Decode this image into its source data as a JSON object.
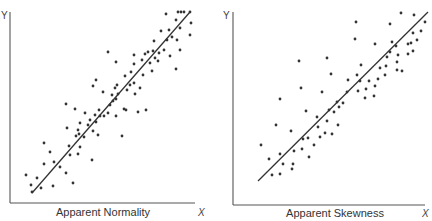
{
  "chart_data": [
    {
      "type": "scatter",
      "title": "Apparent Normality",
      "xlabel": "X",
      "ylabel": "Y",
      "grid": false,
      "legend": null,
      "axes": {
        "origin": [
          10,
          203
        ],
        "x_end": 195,
        "y_top": 12
      },
      "fit_line": {
        "x1": 32,
        "y1": 193,
        "x2": 190,
        "y2": 12
      },
      "points": [
        [
          26,
          175
        ],
        [
          31,
          185
        ],
        [
          37,
          178
        ],
        [
          32,
          192
        ],
        [
          41,
          188
        ],
        [
          53,
          186
        ],
        [
          73,
          183
        ],
        [
          44,
          143
        ],
        [
          50,
          152
        ],
        [
          44,
          164
        ],
        [
          54,
          162
        ],
        [
          60,
          167
        ],
        [
          66,
          173
        ],
        [
          66,
          104
        ],
        [
          75,
          109
        ],
        [
          67,
          128
        ],
        [
          69,
          146
        ],
        [
          70,
          155
        ],
        [
          78,
          154
        ],
        [
          79,
          134
        ],
        [
          76,
          136
        ],
        [
          78,
          130
        ],
        [
          80,
          123
        ],
        [
          80,
          147
        ],
        [
          85,
          113
        ],
        [
          84,
          137
        ],
        [
          88,
          125
        ],
        [
          90,
          120
        ],
        [
          93,
          131
        ],
        [
          93,
          86
        ],
        [
          96,
          80
        ],
        [
          92,
          160
        ],
        [
          95,
          115
        ],
        [
          96,
          122
        ],
        [
          98,
          135
        ],
        [
          99,
          110
        ],
        [
          100,
          116
        ],
        [
          103,
          92
        ],
        [
          104,
          116
        ],
        [
          108,
          113
        ],
        [
          108,
          52
        ],
        [
          110,
          105
        ],
        [
          112,
          95
        ],
        [
          113,
          101
        ],
        [
          115,
          88
        ],
        [
          116,
          99
        ],
        [
          116,
          62
        ],
        [
          117,
          85
        ],
        [
          116,
          116
        ],
        [
          118,
          94
        ],
        [
          122,
          136
        ],
        [
          124,
          109
        ],
        [
          125,
          76
        ],
        [
          127,
          90
        ],
        [
          126,
          110
        ],
        [
          130,
          85
        ],
        [
          131,
          72
        ],
        [
          134,
          83
        ],
        [
          134,
          55
        ],
        [
          134,
          64
        ],
        [
          135,
          94
        ],
        [
          138,
          112
        ],
        [
          140,
          88
        ],
        [
          142,
          60
        ],
        [
          143,
          75
        ],
        [
          146,
          110
        ],
        [
          145,
          54
        ],
        [
          148,
          52
        ],
        [
          150,
          63
        ],
        [
          152,
          71
        ],
        [
          153,
          51
        ],
        [
          154,
          41
        ],
        [
          155,
          58
        ],
        [
          158,
          61
        ],
        [
          159,
          53
        ],
        [
          161,
          31
        ],
        [
          164,
          50
        ],
        [
          166,
          14
        ],
        [
          167,
          40
        ],
        [
          169,
          30
        ],
        [
          170,
          56
        ],
        [
          172,
          37
        ],
        [
          176,
          69
        ],
        [
          176,
          20
        ],
        [
          177,
          40
        ],
        [
          178,
          12
        ],
        [
          180,
          28
        ],
        [
          180,
          50
        ],
        [
          181,
          12
        ],
        [
          184,
          12
        ],
        [
          190,
          12
        ],
        [
          191,
          23
        ],
        [
          190,
          35
        ]
      ]
    },
    {
      "type": "scatter",
      "title": "Apparent Skewness",
      "xlabel": "X",
      "ylabel": "Y",
      "grid": false,
      "legend": null,
      "axes": {
        "origin": [
          233,
          205
        ],
        "x_end": 425,
        "y_top": 12
      },
      "fit_line": {
        "x1": 258,
        "y1": 181,
        "x2": 428,
        "y2": 12
      },
      "points": [
        [
          261,
          145
        ],
        [
          269,
          159
        ],
        [
          272,
          175
        ],
        [
          280,
          99
        ],
        [
          276,
          125
        ],
        [
          280,
          174
        ],
        [
          280,
          154
        ],
        [
          283,
          164
        ],
        [
          291,
          131
        ],
        [
          292,
          169
        ],
        [
          293,
          164
        ],
        [
          294,
          151
        ],
        [
          299,
          61
        ],
        [
          301,
          88
        ],
        [
          302,
          149
        ],
        [
          303,
          139
        ],
        [
          306,
          111
        ],
        [
          308,
          138
        ],
        [
          309,
          157
        ],
        [
          314,
          145
        ],
        [
          318,
          127
        ],
        [
          317,
          117
        ],
        [
          320,
          137
        ],
        [
          322,
          92
        ],
        [
          325,
          133
        ],
        [
          327,
          58
        ],
        [
          327,
          121
        ],
        [
          329,
          110
        ],
        [
          331,
          74
        ],
        [
          332,
          134
        ],
        [
          334,
          112
        ],
        [
          337,
          102
        ],
        [
          338,
          125
        ],
        [
          339,
          107
        ],
        [
          343,
          103
        ],
        [
          347,
          92
        ],
        [
          348,
          80
        ],
        [
          355,
          39
        ],
        [
          356,
          22
        ],
        [
          357,
          75
        ],
        [
          358,
          91
        ],
        [
          361,
          65
        ],
        [
          360,
          81
        ],
        [
          365,
          98
        ],
        [
          366,
          89
        ],
        [
          369,
          81
        ],
        [
          374,
          96
        ],
        [
          375,
          86
        ],
        [
          375,
          44
        ],
        [
          378,
          79
        ],
        [
          380,
          68
        ],
        [
          385,
          75
        ],
        [
          386,
          66
        ],
        [
          387,
          57
        ],
        [
          390,
          24
        ],
        [
          390,
          52
        ],
        [
          392,
          42
        ],
        [
          396,
          46
        ],
        [
          397,
          70
        ],
        [
          397,
          62
        ],
        [
          398,
          55
        ],
        [
          401,
          13
        ],
        [
          402,
          71
        ],
        [
          408,
          54
        ],
        [
          408,
          44
        ],
        [
          411,
          43
        ],
        [
          413,
          51
        ],
        [
          414,
          15
        ],
        [
          413,
          33
        ],
        [
          417,
          40
        ],
        [
          421,
          31
        ],
        [
          425,
          22
        ]
      ]
    }
  ],
  "panels": [
    {
      "caption": "Apparent Normality",
      "x_axis_letter": "X",
      "y_axis_letter": "Y"
    },
    {
      "caption": "Apparent Skewness",
      "x_axis_letter": "X",
      "y_axis_letter": "Y"
    }
  ]
}
